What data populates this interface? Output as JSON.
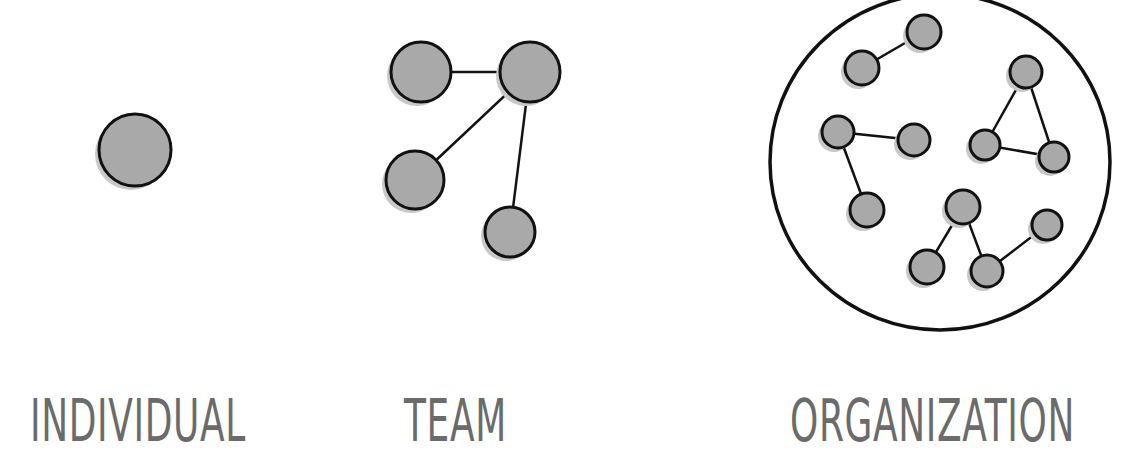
{
  "labels": {
    "individual": "INDIVIDUAL",
    "team": "TEAM",
    "organization": "ORGANIZATION"
  },
  "colors": {
    "node_fill": "#a9a9a9",
    "node_shadow": "#c8c8c8",
    "stroke": "#111111",
    "label": "#6b6b6b",
    "background": "#ffffff"
  },
  "groups": {
    "individual": {
      "nodes": [
        {
          "x": 135,
          "y": 150,
          "r": 36
        }
      ],
      "edges": []
    },
    "team": {
      "nodes": [
        {
          "x": 421,
          "y": 72,
          "r": 30
        },
        {
          "x": 530,
          "y": 72,
          "r": 30
        },
        {
          "x": 415,
          "y": 180,
          "r": 29
        },
        {
          "x": 510,
          "y": 232,
          "r": 25
        }
      ],
      "edges": [
        [
          0,
          1
        ],
        [
          1,
          2
        ],
        [
          1,
          3
        ]
      ]
    },
    "organization": {
      "boundary": {
        "cx": 940,
        "cy": 162,
        "rx": 170,
        "ry": 168
      },
      "nodes": [
        {
          "x": 924,
          "y": 32,
          "r": 17
        },
        {
          "x": 862,
          "y": 68,
          "r": 17
        },
        {
          "x": 838,
          "y": 132,
          "r": 16
        },
        {
          "x": 914,
          "y": 140,
          "r": 16
        },
        {
          "x": 1026,
          "y": 72,
          "r": 16
        },
        {
          "x": 985,
          "y": 145,
          "r": 15
        },
        {
          "x": 1054,
          "y": 157,
          "r": 15
        },
        {
          "x": 867,
          "y": 210,
          "r": 17
        },
        {
          "x": 963,
          "y": 207,
          "r": 17
        },
        {
          "x": 927,
          "y": 267,
          "r": 17
        },
        {
          "x": 987,
          "y": 271,
          "r": 16
        },
        {
          "x": 1047,
          "y": 225,
          "r": 15
        }
      ],
      "edges": [
        [
          0,
          1
        ],
        [
          2,
          3
        ],
        [
          2,
          7
        ],
        [
          4,
          5
        ],
        [
          4,
          6
        ],
        [
          5,
          6
        ],
        [
          8,
          9
        ],
        [
          8,
          10
        ],
        [
          10,
          11
        ]
      ]
    }
  }
}
